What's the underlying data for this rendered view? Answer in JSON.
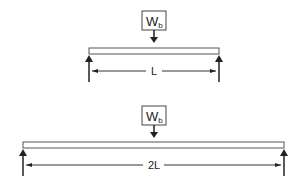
{
  "diagrams": [
    {
      "name": "short-beam",
      "load_label": "W",
      "load_subscript": "b",
      "span_label": "L"
    },
    {
      "name": "long-beam",
      "load_label": "W",
      "load_subscript": "b",
      "span_label": "2L"
    }
  ],
  "colors": {
    "stroke": "#222222",
    "beam_fill": "#ffffff"
  }
}
